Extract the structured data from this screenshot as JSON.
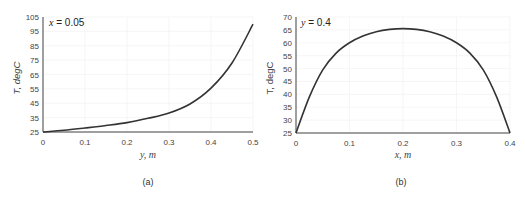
{
  "chart_data": [
    {
      "type": "line",
      "panel": "(a)",
      "annotation": {
        "var": "x",
        "text": " = 0.05"
      },
      "xlabel": "y, m",
      "ylabel": "T, degC",
      "xlim": [
        0,
        0.5
      ],
      "ylim": [
        25,
        105
      ],
      "xticks": [
        "0",
        "0.1",
        "0.2",
        "0.3",
        "0.4",
        "0.5"
      ],
      "yticks": [
        "25",
        "35",
        "45",
        "55",
        "65",
        "75",
        "85",
        "95",
        "105"
      ],
      "grid": true,
      "series": [
        {
          "name": "T(y) at x = 0.05",
          "x": [
            0,
            0.05,
            0.1,
            0.15,
            0.2,
            0.25,
            0.3,
            0.35,
            0.4,
            0.45,
            0.5
          ],
          "y": [
            25,
            26.2,
            27.8,
            29.5,
            31.5,
            34.5,
            38.2,
            44.5,
            55.5,
            73,
            100
          ]
        }
      ]
    },
    {
      "type": "line",
      "panel": "(b)",
      "annotation": {
        "var": "y",
        "text": " = 0.4"
      },
      "xlabel": "x, m",
      "ylabel": "T, degC",
      "xlim": [
        0,
        0.4
      ],
      "ylim": [
        25,
        70
      ],
      "xticks": [
        "0",
        "0.1",
        "0.2",
        "0.3",
        "0.4"
      ],
      "yticks": [
        "25",
        "30",
        "35",
        "40",
        "45",
        "50",
        "55",
        "60",
        "65",
        "70"
      ],
      "grid": true,
      "series": [
        {
          "name": "T(x) at y = 0.4",
          "x": [
            0,
            0.025,
            0.05,
            0.075,
            0.1,
            0.125,
            0.15,
            0.175,
            0.2,
            0.225,
            0.25,
            0.275,
            0.3,
            0.325,
            0.35,
            0.375,
            0.4
          ],
          "y": [
            25,
            39,
            49.5,
            56,
            60,
            62.6,
            64.3,
            65.2,
            65.5,
            65.2,
            64.3,
            62.6,
            60,
            56,
            49.5,
            39,
            25
          ]
        }
      ]
    }
  ],
  "captions": {
    "a": "(a)",
    "b": "(b)"
  }
}
